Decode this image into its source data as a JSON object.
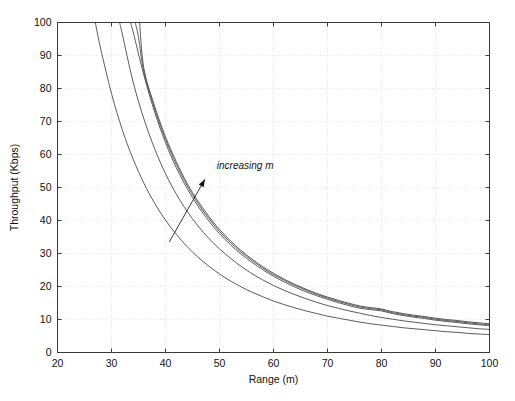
{
  "figure": {
    "background_color": "#ffffff",
    "axes_color": "#3a3a3a",
    "grid_color": "#d8d8d8",
    "curve_color": "#4a4a4a",
    "text_color": "#111111"
  },
  "chart_data": {
    "type": "line",
    "title": "",
    "xlabel": "Range (m)",
    "ylabel": "Throughput (Kbps)",
    "xlim": [
      20,
      100
    ],
    "ylim": [
      0,
      100
    ],
    "xticks": [
      20,
      30,
      40,
      50,
      60,
      70,
      80,
      90,
      100
    ],
    "yticks": [
      0,
      10,
      20,
      30,
      40,
      50,
      60,
      70,
      80,
      90,
      100
    ],
    "xtick_labels": [
      "20",
      "30",
      "40",
      "50",
      "60",
      "70",
      "80",
      "90",
      "100"
    ],
    "ytick_labels": [
      "0",
      "10",
      "20",
      "30",
      "40",
      "50",
      "60",
      "70",
      "80",
      "90",
      "100"
    ],
    "grid": true,
    "grid_style": "dotted",
    "legend": null,
    "legend_position": "none",
    "annotations": [
      {
        "text": "increasing  m",
        "style": "italic",
        "x": 49.5,
        "y": 55.5,
        "arrow_from": [
          40.7,
          33.5
        ],
        "arrow_to": [
          47.3,
          52.5
        ]
      }
    ],
    "series": [
      {
        "name": "m=1",
        "comment": "lowest curve, smallest m",
        "x": [
          27.0,
          28,
          30,
          32,
          34,
          36,
          38,
          40,
          42,
          44,
          46,
          48,
          50,
          52,
          54,
          56,
          58,
          60,
          62,
          64,
          66,
          68,
          70,
          72,
          74,
          76,
          78,
          80,
          82,
          84,
          86,
          88,
          90,
          92,
          94,
          96,
          98,
          100
        ],
        "y": [
          100.0,
          92.0,
          78.5,
          67.5,
          58.6,
          51.3,
          45.2,
          40.1,
          35.8,
          32.1,
          28.9,
          26.2,
          23.8,
          21.7,
          19.9,
          18.3,
          16.9,
          15.6,
          14.5,
          13.5,
          12.6,
          11.8,
          11.0,
          10.4,
          9.8,
          9.2,
          8.7,
          8.3,
          7.9,
          7.5,
          7.2,
          6.9,
          6.6,
          6.3,
          6.1,
          5.8,
          5.6,
          5.4
        ]
      },
      {
        "name": "m=2",
        "x": [
          31.5,
          32,
          34,
          36,
          38,
          40,
          42,
          44,
          46,
          48,
          50,
          52,
          54,
          56,
          58,
          60,
          62,
          64,
          66,
          68,
          70,
          72,
          74,
          76,
          78,
          80,
          82,
          84,
          86,
          88,
          90,
          92,
          94,
          96,
          98,
          100
        ],
        "y": [
          100.0,
          96.5,
          82.0,
          70.8,
          61.7,
          54.2,
          48.0,
          42.8,
          38.4,
          34.6,
          31.4,
          28.6,
          26.1,
          23.9,
          22.0,
          20.3,
          18.8,
          17.5,
          16.3,
          15.2,
          14.2,
          13.4,
          12.6,
          11.9,
          11.2,
          10.6,
          10.1,
          9.6,
          9.2,
          8.8,
          8.4,
          8.1,
          7.8,
          7.5,
          7.2,
          7.0
        ]
      },
      {
        "name": "m=3",
        "x": [
          33.5,
          34,
          36,
          38,
          40,
          42,
          44,
          46,
          48,
          50,
          52,
          54,
          56,
          58,
          60,
          62,
          64,
          66,
          68,
          70,
          72,
          74,
          76,
          78,
          80,
          82,
          84,
          86,
          88,
          90,
          92,
          94,
          96,
          98,
          100
        ],
        "y": [
          100.0,
          97.2,
          84.0,
          72.8,
          63.6,
          56.0,
          49.7,
          44.4,
          39.9,
          36.0,
          32.7,
          29.8,
          27.3,
          25.1,
          23.1,
          21.4,
          19.8,
          18.4,
          17.2,
          16.1,
          15.1,
          14.2,
          13.4,
          13.0,
          12.6,
          11.8,
          11.2,
          10.7,
          10.3,
          9.8,
          9.4,
          9.1,
          8.7,
          8.4,
          8.1
        ]
      },
      {
        "name": "m=4",
        "x": [
          34.4,
          35,
          36,
          38,
          40,
          42,
          44,
          46,
          48,
          50,
          52,
          54,
          56,
          58,
          60,
          62,
          64,
          66,
          68,
          70,
          72,
          74,
          76,
          78,
          80,
          82,
          84,
          86,
          88,
          90,
          92,
          94,
          96,
          98,
          100
        ],
        "y": [
          100.0,
          95.5,
          85.0,
          73.8,
          64.6,
          57.0,
          50.6,
          45.2,
          40.7,
          36.7,
          33.4,
          30.4,
          27.9,
          25.6,
          23.6,
          21.9,
          20.3,
          18.9,
          17.6,
          16.5,
          15.5,
          14.6,
          13.8,
          13.3,
          12.9,
          12.1,
          11.5,
          11.0,
          10.6,
          10.1,
          9.7,
          9.4,
          9.0,
          8.7,
          8.4
        ]
      },
      {
        "name": "m=5",
        "comment": "highest curve, largest m",
        "x": [
          35.2,
          36,
          38,
          40,
          42,
          44,
          46,
          48,
          50,
          52,
          54,
          56,
          58,
          60,
          62,
          64,
          66,
          68,
          70,
          72,
          74,
          76,
          78,
          80,
          82,
          84,
          86,
          88,
          90,
          92,
          94,
          96,
          98,
          100
        ],
        "y": [
          100.0,
          86.0,
          74.6,
          65.4,
          57.8,
          51.3,
          45.9,
          41.3,
          37.3,
          33.9,
          30.9,
          28.3,
          26.0,
          24.0,
          22.2,
          20.6,
          19.2,
          17.9,
          16.8,
          15.8,
          14.9,
          14.1,
          13.6,
          13.2,
          12.4,
          11.8,
          11.3,
          10.9,
          10.4,
          10.0,
          9.7,
          9.3,
          9.0,
          8.7
        ]
      }
    ]
  }
}
